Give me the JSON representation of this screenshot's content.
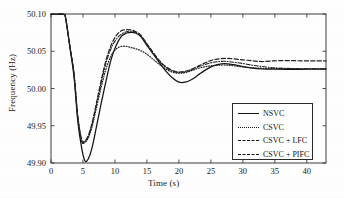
{
  "chart_data": {
    "type": "line",
    "title": "",
    "xlabel": "Time (s)",
    "ylabel": "Frequency (Hz)",
    "xlim": [
      0,
      43
    ],
    "ylim": [
      49.9,
      50.1
    ],
    "xticks": [
      0,
      5,
      10,
      15,
      20,
      25,
      30,
      35,
      40
    ],
    "yticks": [
      49.9,
      49.95,
      50.0,
      50.05,
      50.1
    ],
    "xtick_labels": [
      "0",
      "5",
      "10",
      "15",
      "20",
      "25",
      "30",
      "35",
      "40"
    ],
    "ytick_labels": [
      "49.90",
      "49.95",
      "50.00",
      "50.05",
      "50.10"
    ],
    "grid": false,
    "legend_position": "lower right",
    "series": [
      {
        "name": "NSVC",
        "style": "solid",
        "color": "#111111",
        "x": [
          0,
          1.0,
          2.0,
          2.3,
          3.0,
          3.6,
          4.2,
          4.8,
          5.3,
          5.8,
          6.4,
          7.0,
          7.8,
          8.6,
          9.4,
          10.2,
          11.0,
          11.8,
          12.6,
          13.2,
          14.0,
          15.0,
          16.0,
          17.0,
          18.0,
          19.0,
          20.0,
          21.0,
          22.0,
          23.0,
          24.0,
          25.0,
          26.0,
          27.2,
          28.5,
          30.0,
          31.5,
          33.0,
          35.0,
          37.0,
          39.0,
          41.0,
          43.0
        ],
        "y": [
          50.0995,
          50.0995,
          50.0995,
          50.094,
          50.052,
          50.016,
          49.955,
          49.92,
          49.903,
          49.905,
          49.92,
          49.944,
          49.978,
          50.01,
          50.039,
          50.058,
          50.07,
          50.0745,
          50.0755,
          50.0745,
          50.07,
          50.058,
          50.046,
          50.034,
          50.023,
          50.014,
          50.0085,
          50.0085,
          50.012,
          50.018,
          50.024,
          50.029,
          50.032,
          50.0335,
          50.032,
          50.0295,
          50.0275,
          50.0265,
          50.026,
          50.0258,
          50.0258,
          50.026,
          50.026
        ]
      },
      {
        "name": "CSVC",
        "style": "dotted",
        "color": "#222222",
        "x": [
          0,
          1.0,
          2.0,
          2.3,
          3.0,
          3.6,
          4.2,
          4.8,
          5.2,
          5.8,
          6.4,
          7.0,
          7.8,
          8.6,
          9.4,
          10.2,
          11.0,
          11.8,
          12.6,
          13.2,
          14.0,
          15.0,
          16.0,
          17.0,
          18.0,
          19.0,
          20.0,
          21.0,
          22.0,
          23.0,
          24.0,
          25.0,
          26.0,
          27.2,
          28.5,
          30.0,
          31.5,
          33.0,
          35.0,
          37.0,
          39.0,
          41.0,
          43.0
        ],
        "y": [
          50.0995,
          50.0995,
          50.0995,
          50.094,
          50.054,
          50.019,
          49.96,
          49.929,
          49.927,
          49.933,
          49.948,
          49.97,
          50.0,
          50.026,
          50.044,
          50.053,
          50.0565,
          50.0565,
          50.0548,
          50.0535,
          50.051,
          50.046,
          50.039,
          50.032,
          50.026,
          50.022,
          50.0205,
          50.0215,
          50.024,
          50.027,
          50.029,
          50.0305,
          50.0312,
          50.0315,
          50.0305,
          50.029,
          50.0278,
          50.0272,
          50.0268,
          50.0266,
          50.0265,
          50.0265,
          50.0265
        ]
      },
      {
        "name": "CSVC + LFC",
        "style": "dashdot",
        "color": "#222222",
        "x": [
          0,
          1.0,
          2.0,
          2.3,
          3.0,
          3.6,
          4.2,
          4.8,
          5.2,
          5.8,
          6.4,
          7.0,
          7.8,
          8.6,
          9.4,
          10.2,
          11.0,
          11.8,
          12.6,
          13.2,
          14.0,
          15.0,
          16.0,
          17.0,
          18.0,
          19.0,
          20.0,
          21.0,
          22.0,
          23.0,
          24.0,
          25.0,
          26.0,
          27.2,
          28.5,
          30.0,
          31.5,
          33.0,
          35.0,
          37.0,
          39.0,
          41.0,
          43.0
        ],
        "y": [
          50.0995,
          50.0995,
          50.0995,
          50.094,
          50.054,
          50.019,
          49.961,
          49.93,
          49.928,
          49.935,
          49.951,
          49.974,
          50.006,
          50.034,
          50.054,
          50.066,
          50.073,
          50.0762,
          50.0768,
          50.0755,
          50.071,
          50.059,
          50.047,
          50.036,
          50.028,
          50.0232,
          50.0215,
          50.0225,
          50.025,
          50.029,
          50.032,
          50.0345,
          50.036,
          50.0365,
          50.0353,
          50.0335,
          50.0312,
          50.0295,
          50.0278,
          50.027,
          50.0266,
          50.0265,
          50.0265
        ]
      },
      {
        "name": "CSVC + PIFC",
        "style": "dashed",
        "color": "#222222",
        "x": [
          0,
          1.0,
          2.0,
          2.3,
          3.0,
          3.6,
          4.2,
          4.8,
          5.2,
          5.8,
          6.4,
          7.0,
          7.8,
          8.6,
          9.4,
          10.2,
          11.0,
          11.8,
          12.6,
          13.2,
          14.0,
          15.0,
          16.0,
          17.0,
          18.0,
          19.0,
          20.0,
          21.0,
          22.0,
          23.0,
          24.0,
          25.0,
          26.0,
          27.2,
          28.5,
          30.0,
          31.5,
          33.0,
          35.0,
          37.0,
          39.0,
          41.0,
          43.0
        ],
        "y": [
          50.0995,
          50.0995,
          50.0995,
          50.094,
          50.055,
          50.02,
          49.962,
          49.931,
          49.929,
          49.936,
          49.953,
          49.976,
          50.009,
          50.038,
          50.058,
          50.071,
          50.0775,
          50.079,
          50.0785,
          50.0765,
          50.072,
          50.06,
          50.048,
          50.037,
          50.029,
          50.0242,
          50.0222,
          50.0232,
          50.026,
          50.03,
          50.034,
          50.0375,
          50.0395,
          50.0405,
          50.0398,
          50.0385,
          50.0372,
          50.0362,
          50.0372,
          50.0375,
          50.0372,
          50.037,
          50.037
        ]
      }
    ]
  },
  "legend": {
    "items": [
      {
        "label": "NSVC",
        "style": "solid"
      },
      {
        "label": "CSVC",
        "style": "dotted"
      },
      {
        "label": "CSVC + LFC",
        "style": "dashdot"
      },
      {
        "label": "CSVC + PIFC",
        "style": "dashed"
      }
    ]
  }
}
